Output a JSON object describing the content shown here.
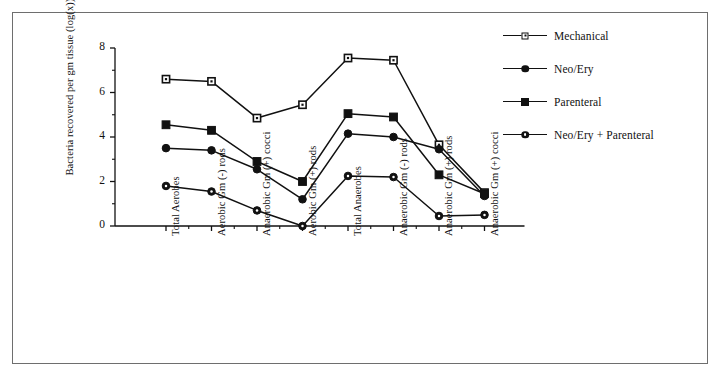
{
  "figure": {
    "border_color": "#6e6e6e",
    "background": "#ffffff",
    "ink_color": "#111111"
  },
  "chart_data": {
    "type": "line",
    "title": "",
    "xlabel": "",
    "ylabel": "Bacteria recovered per gm tissue (log(x))",
    "ylim": [
      0,
      8
    ],
    "yticks": [
      0,
      2,
      4,
      6,
      8
    ],
    "yticks_minor": [
      1,
      3,
      5,
      7
    ],
    "grid": false,
    "legend_position": "right",
    "categories": [
      "Total Aerobes",
      "Aerobic Gm (-) rods",
      "Anaerobic Gm (+) cocci",
      "Aerobic Gm (+) rods",
      "Total Anaerobes",
      "Anaerobic Gm (-) rods",
      "Anaerobic Gm (+) rods",
      "Anaerobic Gm (+) cocci"
    ],
    "series": [
      {
        "name": "Mechanical",
        "marker": "open-square",
        "values": [
          6.6,
          6.5,
          4.85,
          5.45,
          7.55,
          7.45,
          3.65,
          1.5
        ]
      },
      {
        "name": "Neo/Ery",
        "marker": "filled-circle",
        "values": [
          3.5,
          3.4,
          2.55,
          1.2,
          4.15,
          4.0,
          3.45,
          1.35
        ]
      },
      {
        "name": "Parenteral",
        "marker": "filled-square",
        "values": [
          4.55,
          4.3,
          2.9,
          2.0,
          5.05,
          4.9,
          2.3,
          1.45
        ]
      },
      {
        "name": "Neo/Ery + Parenteral",
        "marker": "dot-circle",
        "values": [
          1.8,
          1.55,
          0.7,
          0.0,
          2.25,
          2.2,
          0.45,
          0.5
        ]
      }
    ]
  },
  "legend": {
    "items": [
      {
        "label": "Mechanical",
        "marker": "open-square"
      },
      {
        "label": "Neo/Ery",
        "marker": "filled-circle"
      },
      {
        "label": "Parenteral",
        "marker": "filled-square"
      },
      {
        "label": "Neo/Ery + Parenteral",
        "marker": "dot-circle"
      }
    ]
  },
  "axes": {
    "y_title": "Bacteria recovered per gm tissue (log(x))",
    "y_tick_labels": [
      "8",
      "6",
      "4",
      "2",
      "0"
    ]
  }
}
